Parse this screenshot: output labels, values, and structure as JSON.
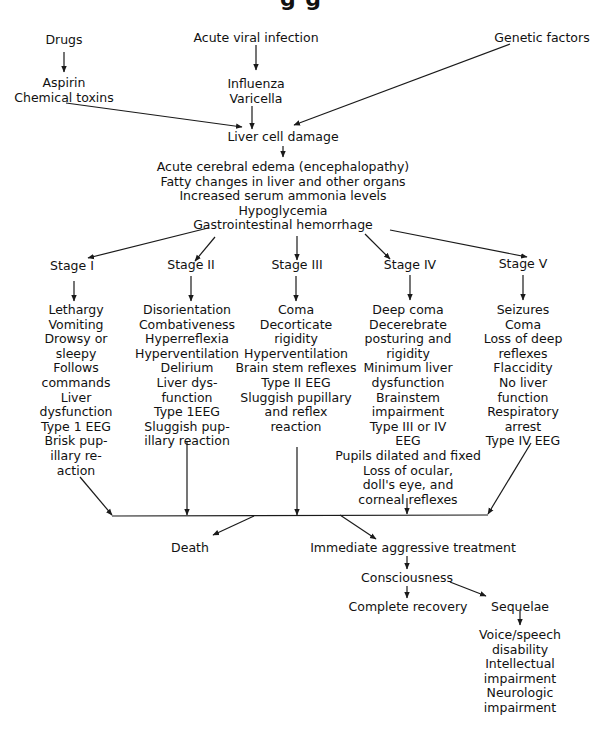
{
  "title_fragment": "g   g",
  "sources": {
    "drugs": {
      "label": "Drugs",
      "children": [
        "Aspirin",
        "Chemical toxins"
      ]
    },
    "viral": {
      "label": "Acute viral infection",
      "children": [
        "Influenza",
        "Varicella"
      ]
    },
    "genetic": {
      "label": "Genetic factors"
    }
  },
  "central": {
    "label": "Liver cell damage",
    "effects": [
      "Acute cerebral edema (encephalopathy)",
      "Fatty changes in liver and other organs",
      "Increased serum ammonia levels",
      "Hypoglycemia",
      "Gastrointestinal hemorrhage"
    ]
  },
  "stages": [
    {
      "label": "Stage I",
      "items": [
        "Lethargy",
        "Vomiting",
        "Drowsy or",
        "sleepy",
        "Follows",
        "commands",
        "Liver",
        "dysfunction",
        "Type 1 EEG",
        "Brisk pup-",
        "illary re-",
        "action"
      ]
    },
    {
      "label": "Stage II",
      "items": [
        "Disorientation",
        "Combativeness",
        "Hyperreflexia",
        "Hyperventilation",
        "Delirium",
        "Liver dys-",
        "function",
        "Type 1EEG",
        "Sluggish pup-",
        "illary reaction"
      ]
    },
    {
      "label": "Stage III",
      "items": [
        "Coma",
        "Decorticate",
        "rigidity",
        "Hyperventilation",
        "Brain stem reflexes",
        "Type II EEG",
        "Sluggish pupillary",
        "and reflex",
        "reaction"
      ]
    },
    {
      "label": "Stage IV",
      "items": [
        "Deep coma",
        "Decerebrate",
        "posturing and",
        "rigidity",
        "Minimum liver",
        "dysfunction",
        "Brainstem",
        "impairment",
        "Type III or IV",
        "EEG",
        "Pupils dilated and fixed",
        "Loss of ocular,",
        "doll's eye, and",
        "corneal reflexes"
      ]
    },
    {
      "label": "Stage V",
      "items": [
        "Seizures",
        "Coma",
        "Loss of deep",
        "reflexes",
        "Flaccidity",
        "No liver",
        "function",
        "Respiratory",
        "arrest",
        "Type IV EEG"
      ]
    }
  ],
  "outcomes": {
    "death": "Death",
    "treatment": "Immediate aggressive treatment",
    "consciousness": "Consciousness",
    "recovery": "Complete recovery",
    "sequelae": "Sequelae",
    "sequelae_items": [
      "Voice/speech",
      "disability",
      "Intellectual",
      "impairment",
      "Neurologic",
      "impairment"
    ]
  },
  "colors": {
    "line": "#1a1a1a",
    "text": "#111111",
    "background": "#ffffff"
  }
}
